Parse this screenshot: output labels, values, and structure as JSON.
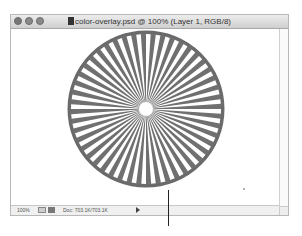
{
  "window": {
    "title": "color-overlay.psd @ 100% (Layer 1, RGB/8)",
    "traffic_lights": [
      "close",
      "minimize",
      "zoom"
    ]
  },
  "canvas": {
    "artwork": "starburst-circle",
    "ray_count": 48,
    "color": "#707070"
  },
  "statusbar": {
    "zoom_level": "100%",
    "doc_size": "Doc: 703.1K/703.1K"
  }
}
